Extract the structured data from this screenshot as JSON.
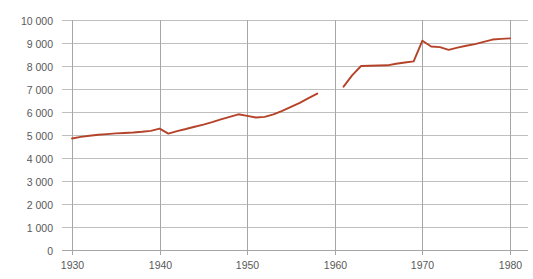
{
  "chart_data": {
    "type": "line",
    "title": "",
    "subtitle": "",
    "xlabel": "",
    "ylabel": "",
    "xlim": [
      1930,
      1980
    ],
    "ylim": [
      0,
      10000
    ],
    "grid": true,
    "legend": "none",
    "y_ticks": [
      0,
      1000,
      2000,
      3000,
      4000,
      5000,
      6000,
      7000,
      8000,
      9000,
      10000
    ],
    "y_tick_labels": [
      "0",
      "1 000",
      "2 000",
      "3 000",
      "4 000",
      "5 000",
      "6 000",
      "7 000",
      "8 000",
      "9 000",
      "10 000"
    ],
    "x_ticks": [
      1930,
      1940,
      1950,
      1960,
      1970,
      1980
    ],
    "x_tick_labels": [
      "1930",
      "1940",
      "1950",
      "1960",
      "1970",
      "1980"
    ],
    "line_color": "#B5432A",
    "series": [
      {
        "name": "segment-1",
        "x": [
          1930,
          1931,
          1932,
          1933,
          1934,
          1935,
          1936,
          1937,
          1938,
          1939,
          1940,
          1941,
          1942,
          1943,
          1944,
          1945,
          1946,
          1947,
          1948,
          1949,
          1950,
          1951,
          1952,
          1953,
          1954,
          1955,
          1956,
          1957,
          1958
        ],
        "values": [
          4850,
          4920,
          4970,
          5010,
          5040,
          5070,
          5090,
          5110,
          5140,
          5180,
          5280,
          5060,
          5170,
          5260,
          5360,
          5450,
          5560,
          5680,
          5790,
          5900,
          5830,
          5760,
          5790,
          5900,
          6050,
          6220,
          6400,
          6600,
          6800
        ]
      },
      {
        "name": "segment-2",
        "x": [
          1961,
          1962,
          1963,
          1964,
          1965,
          1966,
          1967,
          1968,
          1969,
          1970,
          1971,
          1972,
          1973,
          1974,
          1975,
          1976,
          1977,
          1978,
          1979,
          1980
        ],
        "values": [
          7100,
          7600,
          8000,
          8010,
          8020,
          8030,
          8100,
          8150,
          8200,
          9100,
          8850,
          8820,
          8700,
          8800,
          8880,
          8950,
          9050,
          9150,
          9180,
          9200
        ]
      }
    ]
  }
}
